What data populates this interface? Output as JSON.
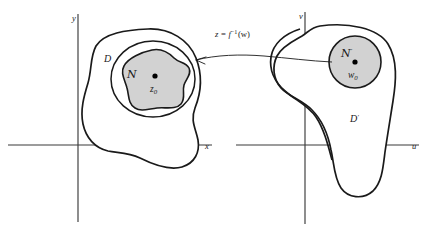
{
  "figure": {
    "caption_present": false,
    "background_color": "#ffffff",
    "ink_color": "#1a1a1a",
    "shade_color": "#d2d2d2",
    "axis_color": "#3a3a3a"
  },
  "left_plane": {
    "name": "z-plane",
    "axes": {
      "vertical_label": "y",
      "horizontal_label": "x"
    },
    "domain_label": "D",
    "neighborhood_label": "ℕ",
    "neighborhood_script": "N",
    "center_point_label": "z",
    "center_point_subscript": "0",
    "shaded": true
  },
  "right_plane": {
    "name": "w-plane",
    "axes": {
      "vertical_label": "v",
      "horizontal_label": "u"
    },
    "domain_label": "D",
    "domain_prime": "′",
    "neighborhood_script": "N",
    "neighborhood_prime": "′",
    "center_point_label": "w",
    "center_point_subscript": "0",
    "shaded": true
  },
  "mapping": {
    "formula_lhs": "z",
    "formula_eq": "=",
    "formula_fn": "f",
    "formula_exp": "−1",
    "formula_arg": "(w)",
    "formula_full": "z = f⁻¹(w)",
    "direction": "right-to-left",
    "arrow_target": "left_plane_shaded_region"
  }
}
